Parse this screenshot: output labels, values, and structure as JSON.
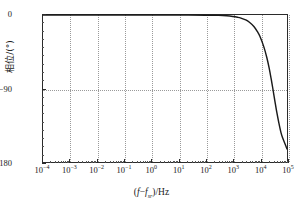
{
  "chart_data": {
    "type": "line",
    "title": "",
    "xlabel": "(f−f_sr)/Hz",
    "ylabel": "相位/(°)",
    "xscale": "log",
    "xlim": [
      0.0001,
      100000
    ],
    "ylim": [
      -180,
      0
    ],
    "grid": true,
    "legend": "none",
    "xticks": [
      {
        "value": 0.0001,
        "mantissa": "10",
        "exponent": "−4"
      },
      {
        "value": 0.001,
        "mantissa": "10",
        "exponent": "−3"
      },
      {
        "value": 0.01,
        "mantissa": "10",
        "exponent": "−2"
      },
      {
        "value": 0.1,
        "mantissa": "10",
        "exponent": "−1"
      },
      {
        "value": 1,
        "mantissa": "10",
        "exponent": "0"
      },
      {
        "value": 10,
        "mantissa": "10",
        "exponent": "1"
      },
      {
        "value": 100,
        "mantissa": "10",
        "exponent": "2"
      },
      {
        "value": 1000,
        "mantissa": "10",
        "exponent": "3"
      },
      {
        "value": 10000,
        "mantissa": "10",
        "exponent": "4"
      },
      {
        "value": 100000,
        "mantissa": "10",
        "exponent": "5"
      }
    ],
    "yticks": [
      {
        "value": 0,
        "label": "0"
      },
      {
        "value": -90,
        "label": "−90"
      },
      {
        "value": -180,
        "label": "−180"
      }
    ],
    "series": [
      {
        "name": "phase",
        "color": "#1a1a1a",
        "x": [
          0.0001,
          0.001,
          0.01,
          0.1,
          1,
          10,
          100,
          300,
          600,
          1000,
          1500,
          2000,
          3000,
          4000,
          6000,
          8000,
          10000,
          14000,
          18000,
          22000,
          26000,
          30000,
          36000,
          42000,
          50000,
          60000,
          70000,
          85000,
          100000
        ],
        "y": [
          0,
          0,
          0,
          0,
          0,
          0,
          -0.2,
          -0.5,
          -1.0,
          -1.8,
          -2.8,
          -3.8,
          -6.0,
          -8.5,
          -14.0,
          -20.0,
          -26.0,
          -39.0,
          -52.0,
          -65.0,
          -78.0,
          -90.0,
          -106.0,
          -119.0,
          -132.0,
          -144.0,
          -151.0,
          -158.0,
          -164.0
        ]
      }
    ]
  },
  "axis_titles": {
    "x_prefix": "(",
    "x_var1": "f",
    "x_minus": "−",
    "x_var2": "f",
    "x_sub": "sr",
    "x_suffix": ")/Hz",
    "y": "相位/(°)"
  }
}
